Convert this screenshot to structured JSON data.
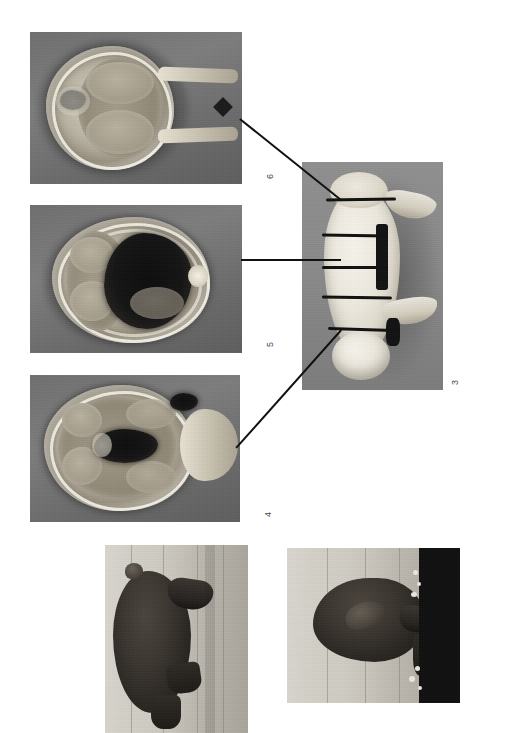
{
  "figure": {
    "orientation": "rotated-90-ccw",
    "background_color": "#ffffff",
    "width": 510,
    "height": 733,
    "caption": ""
  },
  "panels": [
    {
      "id": "panel-6",
      "number": "6",
      "type": "cross-section",
      "description": "Transverse carcass cross-section showing limbs at lower region",
      "frame": {
        "x": 30,
        "y": 32,
        "w": 212,
        "h": 152
      },
      "label_pos": {
        "x": 270,
        "y": 176
      },
      "bg_color": "#6f6f6f"
    },
    {
      "id": "panel-5",
      "number": "5",
      "type": "cross-section",
      "description": "Transverse carcass cross-section through abdominal cavity",
      "frame": {
        "x": 30,
        "y": 205,
        "w": 212,
        "h": 148
      },
      "label_pos": {
        "x": 270,
        "y": 344
      },
      "bg_color": "#6f6f6f"
    },
    {
      "id": "panel-4",
      "number": "4",
      "type": "cross-section",
      "description": "Transverse carcass cross-section through thoracic region with head end",
      "frame": {
        "x": 30,
        "y": 375,
        "w": 210,
        "h": 147
      },
      "label_pos": {
        "x": 268,
        "y": 514
      },
      "bg_color": "#6f6f6f"
    },
    {
      "id": "panel-3",
      "number": "3",
      "type": "specimen-photo",
      "description": "Whole pig carcass marked with transverse section bands",
      "frame": {
        "x": 302,
        "y": 162,
        "w": 141,
        "h": 228
      },
      "label_pos": {
        "x": 455,
        "y": 382
      },
      "bg_color": "#8a8a8a",
      "band_count": 5
    },
    {
      "id": "photo-live-side",
      "number": "",
      "type": "field-photo",
      "description": "Live dark-coated pig standing in a pen, side view",
      "frame": {
        "x": 105,
        "y": 545,
        "w": 143,
        "h": 188
      },
      "bg_color": "#cfccc4"
    },
    {
      "id": "photo-live-head",
      "number": "",
      "type": "field-photo",
      "description": "Live dark-coated pig head close-up in pen",
      "frame": {
        "x": 287,
        "y": 548,
        "w": 173,
        "h": 155
      },
      "bg_color": "#cfccc4"
    }
  ],
  "leaders": [
    {
      "id": "leader-6",
      "from_panel": "panel-6",
      "to_panel": "panel-3",
      "x1": 240,
      "y1": 118,
      "x2": 341,
      "y2": 199
    },
    {
      "id": "leader-5",
      "from_panel": "panel-5",
      "to_panel": "panel-3",
      "x1": 241,
      "y1": 259,
      "x2": 341,
      "y2": 259
    },
    {
      "id": "leader-4",
      "from_panel": "panel-4",
      "to_panel": "panel-3",
      "x1": 236,
      "y1": 447,
      "x2": 341,
      "y2": 329
    }
  ],
  "colors": {
    "page": "#ffffff",
    "leader_line": "#111111",
    "label_text": "#4a4a4a",
    "ct_background": "#6f6f6f",
    "specimen_background": "#8a8a8a",
    "pen_background": "#cfccc4"
  }
}
